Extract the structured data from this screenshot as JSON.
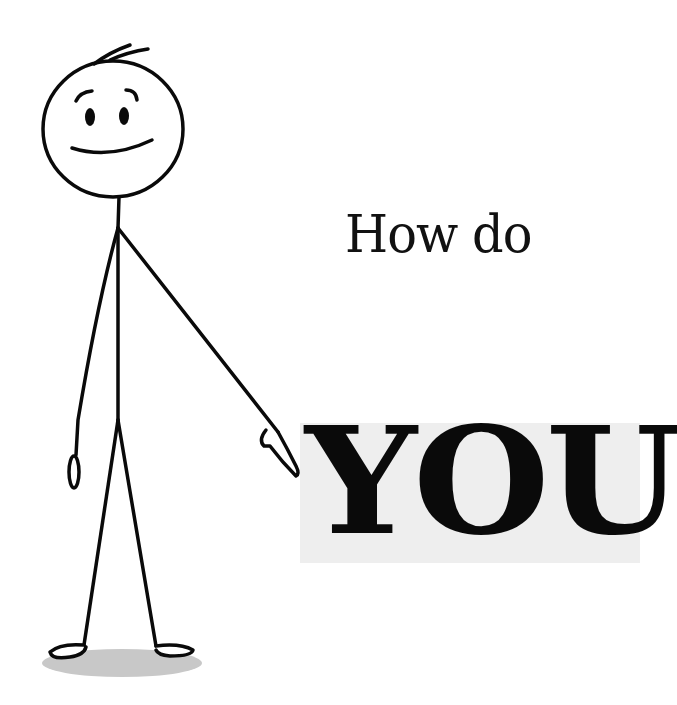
{
  "illustration": {
    "subject": "stick-figure",
    "pose": "pointing-right",
    "expression": "smiling"
  },
  "text": {
    "line1": "How do",
    "line2": "YOU"
  },
  "colors": {
    "background": "#ffffff",
    "ink": "#0a0a0a",
    "highlight_box": "#eeeeee",
    "shadow": "#c8c8c8"
  }
}
